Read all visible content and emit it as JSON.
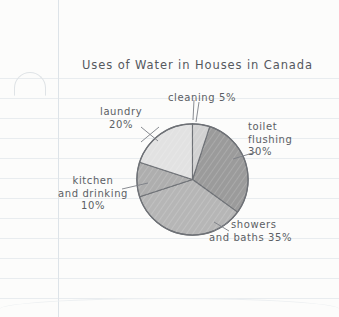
{
  "page": {
    "medium": "lined-notebook-paper",
    "paper_color": "#fcfcfb",
    "rule_line_color": "#e8ecef",
    "margin_line_color": "#dde3e8",
    "ink_color": "#5d6066"
  },
  "chart_data": {
    "type": "pie",
    "title": "Uses of Water in Houses in Canada",
    "xlabel": "",
    "ylabel": "",
    "units": "percent",
    "total": 100,
    "legend_position": "none-labels-with-leader-lines",
    "grid": false,
    "categories": [
      "toilet flushing",
      "showers and baths",
      "kitchen and drinking",
      "laundry",
      "cleaning"
    ],
    "values": [
      30,
      35,
      10,
      20,
      5
    ],
    "slices": [
      {
        "name": "toilet flushing",
        "label_lines": [
          "toilet",
          "flushing",
          "30%"
        ],
        "value": 30,
        "value_text": "30%",
        "color": "#9b9b9b",
        "start_deg": 18,
        "sweep_deg": 108
      },
      {
        "name": "showers and baths",
        "label_lines": [
          "showers",
          "and baths 35%"
        ],
        "value": 35,
        "value_text": "35%",
        "color": "#b6b6b6",
        "start_deg": 126,
        "sweep_deg": 126
      },
      {
        "name": "kitchen and drinking",
        "label_lines": [
          "kitchen",
          "and drinking",
          "10%"
        ],
        "value": 10,
        "value_text": "10%",
        "color": "#aeaeae",
        "start_deg": 252,
        "sweep_deg": 36
      },
      {
        "name": "laundry",
        "label_lines": [
          "laundry",
          "20%"
        ],
        "value": 20,
        "value_text": "20%",
        "color": "#e2e2e2",
        "start_deg": 288,
        "sweep_deg": 72
      },
      {
        "name": "cleaning",
        "label_lines": [
          "cleaning 5%"
        ],
        "value": 5,
        "value_text": "5%",
        "color": "#d2d2d2",
        "start_deg": 0,
        "sweep_deg": 18
      }
    ]
  },
  "labels": {
    "cleaning": {
      "line1": "cleaning 5%"
    },
    "laundry": {
      "line1": "laundry",
      "line2": "20%"
    },
    "toilet": {
      "line1": "toilet",
      "line2": "flushing",
      "line3": "30%"
    },
    "kitchen": {
      "line1": "kitchen",
      "line2": "and drinking",
      "line3": "10%"
    },
    "showers": {
      "line1": "showers",
      "line2": "and baths 35%"
    }
  }
}
